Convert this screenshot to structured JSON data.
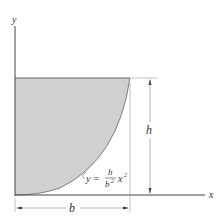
{
  "diagram": {
    "axes": {
      "x_label": "x",
      "y_label": "y"
    },
    "dimensions": {
      "height_label": "h",
      "width_label": "b"
    },
    "curve": {
      "equation_prefix": "y =",
      "numerator": "h",
      "denominator": "b",
      "denominator_exp": "2",
      "variable": "x",
      "variable_exp": "2"
    },
    "colors": {
      "fill": "#d0d0d0",
      "line": "#555555",
      "dim_line": "#888888"
    }
  }
}
